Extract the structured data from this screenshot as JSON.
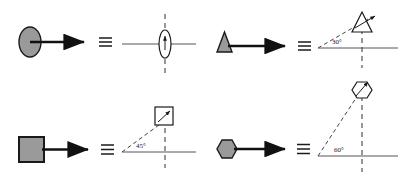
{
  "figure": {
    "type": "symmetry-equivalence-diagram",
    "background_color": "#ffffff",
    "shape_fill_color": "#9a9a9a",
    "shape_stroke_color": "#1a1a1a",
    "axis_color": "#555555",
    "dashed_color": "#444444",
    "arrow_color": "#111111",
    "equivalence_symbol": "≡",
    "panels": [
      {
        "id": "panel-ellipse",
        "position": "top-left",
        "shape_name": "ellipse",
        "shape_filled": true,
        "rotation_label": "",
        "has_rotation_label": false,
        "rotated_shape_name": "ellipse",
        "rotated_shape_filled": false,
        "axis_line": true,
        "dashed_vertical": true,
        "dashed_ray": false,
        "inner_arrow": true
      },
      {
        "id": "panel-triangle",
        "position": "top-right",
        "shape_name": "triangle",
        "shape_filled": true,
        "rotation_label": "30°",
        "has_rotation_label": true,
        "rotated_shape_name": "triangle",
        "rotated_shape_filled": false,
        "axis_line": true,
        "dashed_vertical": true,
        "dashed_ray": true,
        "inner_arrow": true
      },
      {
        "id": "panel-square",
        "position": "bottom-left",
        "shape_name": "square",
        "shape_filled": true,
        "rotation_label": "45°",
        "has_rotation_label": true,
        "rotated_shape_name": "square",
        "rotated_shape_filled": false,
        "axis_line": true,
        "dashed_vertical": true,
        "dashed_ray": true,
        "inner_arrow": true
      },
      {
        "id": "panel-hexagon",
        "position": "bottom-right",
        "shape_name": "hexagon",
        "shape_filled": true,
        "rotation_label": "60°",
        "has_rotation_label": true,
        "rotated_shape_name": "hexagon",
        "rotated_shape_filled": false,
        "axis_line": true,
        "dashed_vertical": true,
        "dashed_ray": true,
        "inner_arrow": true
      }
    ]
  }
}
